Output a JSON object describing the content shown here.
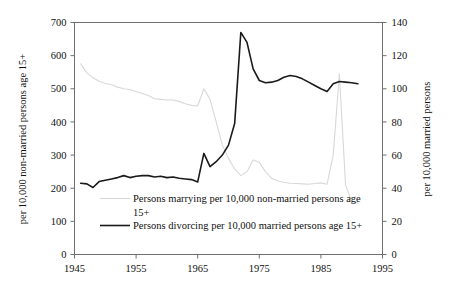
{
  "chart_data": {
    "type": "line",
    "title": "",
    "xlabel": "",
    "ylabel": "per 10,000 non-married persons age 15+",
    "y2label": "per 10,000 married persons",
    "xlim": [
      1945,
      1995
    ],
    "ylim": [
      0,
      700
    ],
    "y2lim": [
      0,
      140
    ],
    "xticks": [
      "1945",
      "1955",
      "1965",
      "1975",
      "1985",
      "1995"
    ],
    "xtick_values": [
      1945,
      1955,
      1965,
      1975,
      1985,
      1995
    ],
    "yticks": [
      "0",
      "100",
      "200",
      "300",
      "400",
      "500",
      "600",
      "700"
    ],
    "ytick_values": [
      0,
      100,
      200,
      300,
      400,
      500,
      600,
      700
    ],
    "y2ticks": [
      "0",
      "20",
      "40",
      "60",
      "80",
      "100",
      "120",
      "140"
    ],
    "y2tick_values": [
      0,
      20,
      40,
      60,
      80,
      100,
      120,
      140
    ],
    "grid": false,
    "legend_position": "inside-bottom-left",
    "series": [
      {
        "name": "Persons marrying per 10,000 non-married persons age 15+",
        "axis": "left",
        "color": "#d8d8d8",
        "x": [
          1946,
          1947,
          1948,
          1949,
          1950,
          1951,
          1952,
          1953,
          1954,
          1955,
          1956,
          1957,
          1958,
          1959,
          1960,
          1961,
          1962,
          1963,
          1964,
          1965,
          1966,
          1967,
          1968,
          1969,
          1970,
          1971,
          1972,
          1973,
          1974,
          1975,
          1976,
          1977,
          1978,
          1979,
          1980,
          1981,
          1982,
          1983,
          1984,
          1985,
          1986,
          1987,
          1988,
          1989,
          1990,
          1991
        ],
        "values": [
          575,
          548,
          533,
          523,
          516,
          512,
          505,
          500,
          498,
          492,
          486,
          480,
          470,
          468,
          466,
          466,
          462,
          455,
          450,
          448,
          500,
          468,
          400,
          330,
          290,
          258,
          238,
          250,
          285,
          278,
          250,
          230,
          222,
          218,
          215,
          214,
          213,
          212,
          214,
          216,
          212,
          300,
          545,
          210,
          160,
          155
        ]
      },
      {
        "name": "Persons divorcing per 10,000 married persons age 15+",
        "axis": "right",
        "color": "#1a1a1a",
        "x": [
          1946,
          1947,
          1948,
          1949,
          1950,
          1951,
          1952,
          1953,
          1954,
          1955,
          1956,
          1957,
          1958,
          1959,
          1960,
          1961,
          1962,
          1963,
          1964,
          1965,
          1966,
          1967,
          1968,
          1969,
          1970,
          1971,
          1972,
          1973,
          1974,
          1975,
          1976,
          1977,
          1978,
          1979,
          1980,
          1981,
          1982,
          1983,
          1984,
          1985,
          1986,
          1987,
          1988,
          1989,
          1990,
          1991
        ],
        "values": [
          215,
          213,
          202,
          220,
          224,
          228,
          232,
          238,
          232,
          236,
          238,
          238,
          234,
          236,
          232,
          234,
          230,
          228,
          226,
          219,
          305,
          265,
          280,
          300,
          330,
          395,
          670,
          640,
          560,
          525,
          518,
          520,
          525,
          535,
          540,
          537,
          530,
          520,
          510,
          500,
          492,
          515,
          522,
          520,
          518,
          515
        ]
      }
    ],
    "legend": [
      {
        "label_line1": "Persons marrying per 10,000 non-married persons age",
        "label_line2": "15+",
        "swatch_color": "#d8d8d8"
      },
      {
        "label_line1": "Persons divorcing per 10,000 married persons age 15+",
        "label_line2": "",
        "swatch_color": "#1a1a1a"
      }
    ]
  },
  "axes": {
    "left_title": "per 10,000 non-married persons age 15+",
    "right_title": "per 10,000 married persons"
  }
}
